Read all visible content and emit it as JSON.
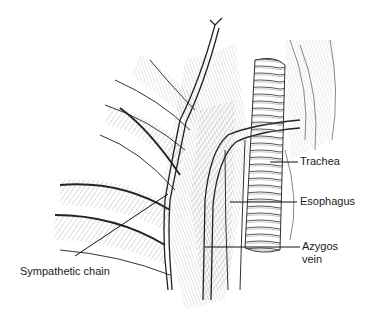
{
  "figure": {
    "labels": [
      {
        "id": "trachea",
        "text": "Trachea"
      },
      {
        "id": "esophagus",
        "text": "Esophagus"
      },
      {
        "id": "azygos-vein",
        "text": "Azygos",
        "text2": "vein"
      },
      {
        "id": "sympathetic-chain",
        "text": "Sympathetic chain"
      }
    ]
  },
  "colors": {
    "ink": "#1a1a1a",
    "background": "#ffffff",
    "shade": "#9a9a9a"
  }
}
